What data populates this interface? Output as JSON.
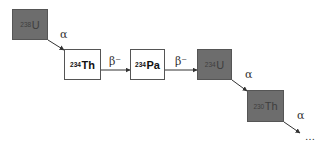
{
  "diagram": {
    "nodes": [
      {
        "id": "u238",
        "mass": "238",
        "symbol": "U",
        "style": "dark"
      },
      {
        "id": "th234",
        "mass": "234",
        "symbol": "Th",
        "style": "light"
      },
      {
        "id": "pa234",
        "mass": "234",
        "symbol": "Pa",
        "style": "light"
      },
      {
        "id": "u234",
        "mass": "234",
        "symbol": "U",
        "style": "dark"
      },
      {
        "id": "th230",
        "mass": "230",
        "symbol": "Th",
        "style": "dark"
      }
    ],
    "edges": [
      {
        "from": "u238",
        "to": "th234",
        "label": "α"
      },
      {
        "from": "th234",
        "to": "pa234",
        "label": "β⁻"
      },
      {
        "from": "pa234",
        "to": "u234",
        "label": "β⁻"
      },
      {
        "from": "u234",
        "to": "th230",
        "label": "α"
      },
      {
        "from": "th230",
        "to": "continuation",
        "label": "α"
      }
    ],
    "continuation": "…",
    "colors": {
      "dark_fill": "#6d6d6d",
      "light_fill": "#ffffff",
      "border": "#555555",
      "arrow": "#333333"
    }
  }
}
